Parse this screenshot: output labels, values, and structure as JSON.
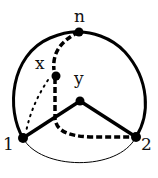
{
  "diagram": {
    "title": "",
    "colors": {
      "stroke": "#000000",
      "background": "#ffffff"
    },
    "nodes": [
      {
        "id": "n",
        "label": "n",
        "x": 79,
        "y": 32
      },
      {
        "id": "x",
        "label": "x",
        "x": 56,
        "y": 76
      },
      {
        "id": "y",
        "label": "y",
        "x": 80,
        "y": 101
      },
      {
        "id": "1",
        "label": "1",
        "x": 23,
        "y": 138
      },
      {
        "id": "2",
        "label": "2",
        "x": 136,
        "y": 137
      }
    ],
    "edges": [
      {
        "from": "1",
        "to": "n",
        "style": "thick-arc"
      },
      {
        "from": "n",
        "to": "2",
        "style": "thick-arc"
      },
      {
        "from": "1",
        "to": "2",
        "style": "thin-arc"
      },
      {
        "from": "1",
        "to": "y",
        "style": "thick"
      },
      {
        "from": "y",
        "to": "2",
        "style": "thick"
      },
      {
        "from": "n",
        "to": "x",
        "style": "dashed"
      },
      {
        "from": "x",
        "to": "2",
        "style": "dashed"
      },
      {
        "from": "x",
        "to": "1",
        "style": "dotted"
      }
    ]
  }
}
